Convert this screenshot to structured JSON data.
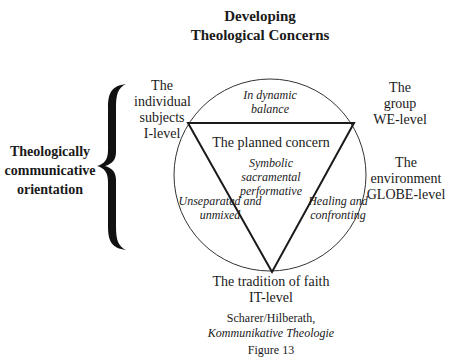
{
  "title": {
    "line1": "Developing",
    "line2": "Theological Concerns"
  },
  "side_label": {
    "line1": "Theologically",
    "line2": "communicative",
    "line3": "orientation"
  },
  "corners": {
    "i_level": {
      "line1": "The",
      "line2": "individual",
      "line3": "subjects",
      "line4": "I-level"
    },
    "we_level": {
      "line1": "The",
      "line2": "group",
      "line3": "WE-level"
    },
    "globe_level": {
      "line1": "The",
      "line2": "environment",
      "line3": "GLOBE-level"
    },
    "it_level": {
      "line1": "The tradition of faith",
      "line2": "IT-level"
    }
  },
  "inner": {
    "top_segment": {
      "line1": "In dynamic",
      "line2": "balance"
    },
    "center_title": "The planned concern",
    "center_sub": {
      "line1": "Symbolic",
      "line2": "sacramental",
      "line3": "performative"
    },
    "left_segment": {
      "line1": "Unseparated and",
      "line2": "unmixed"
    },
    "right_segment": {
      "line1": "Healing and",
      "line2": "confronting"
    }
  },
  "source": {
    "authors": "Scharer/Hilberath,",
    "work": "Kommunikative Theologie"
  },
  "caption": "Figure 13",
  "colors": {
    "ink": "#1a1a1a",
    "background": "#ffffff"
  }
}
